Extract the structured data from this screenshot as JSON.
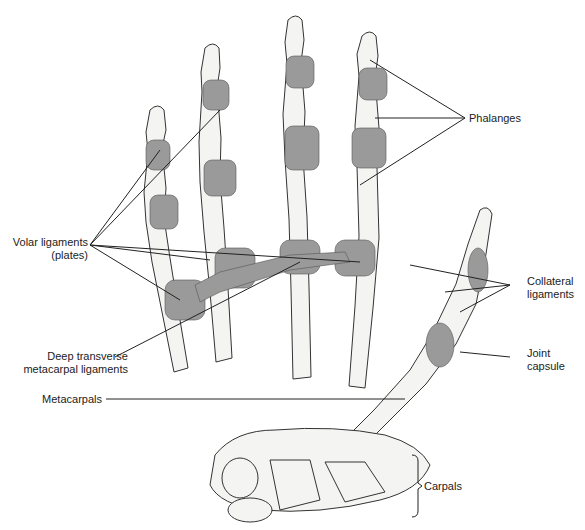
{
  "figure": {
    "labels": {
      "phalanges": "Phalanges",
      "volar_ligaments_line1": "Volar ligaments",
      "volar_ligaments_line2": "(plates)",
      "collateral_line1": "Collateral",
      "collateral_line2": "ligaments",
      "deep_transverse_line1": "Deep transverse",
      "deep_transverse_line2": "metacarpal ligaments",
      "joint_capsule_line1": "Joint",
      "joint_capsule_line2": "capsule",
      "metacarpals": "Metacarpals",
      "carpals": "Carpals"
    },
    "colors": {
      "bone_fill": "#f4f4f2",
      "ligament_fill": "#9a9a9a",
      "outline": "#333333"
    }
  }
}
